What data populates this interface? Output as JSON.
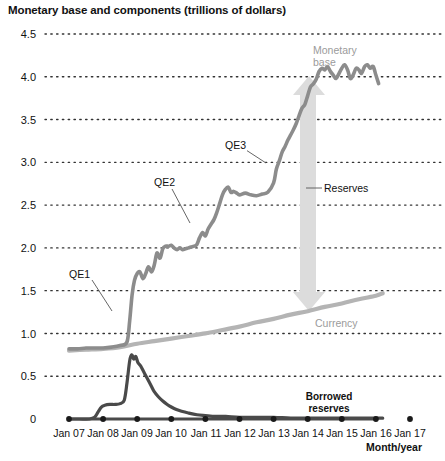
{
  "chart_data": {
    "type": "line",
    "title": "Monetary base and components (trillions of dollars)",
    "xlabel": "Month/year",
    "ylabel": "",
    "ylim": [
      0,
      4.5
    ],
    "ytick_labels": [
      "0",
      "0.5",
      "1.0",
      "1.5",
      "2.0",
      "2.5",
      "3.0",
      "3.5",
      "4.0",
      "4.5"
    ],
    "ytick_values": [
      0,
      0.5,
      1.0,
      1.5,
      2.0,
      2.5,
      3.0,
      3.5,
      4.0,
      4.5
    ],
    "xtick_labels": [
      "Jan 07",
      "Jan 08",
      "Jan 09",
      "Jan 10",
      "Jan 11",
      "Jan 12",
      "Jan 13",
      "Jan 14",
      "Jan 15",
      "Jan 16",
      "Jan 17"
    ],
    "xtick_values": [
      2007,
      2008,
      2009,
      2010,
      2011,
      2012,
      2013,
      2014,
      2015,
      2016,
      2017
    ],
    "xlim": [
      2007,
      2017
    ],
    "grid": "horizontal-dotted",
    "legend": "inline-annotations",
    "series": [
      {
        "name": "Monetary base",
        "color": "#8c8c8c",
        "x": [
          2007.0,
          2007.25,
          2007.5,
          2007.75,
          2008.0,
          2008.25,
          2008.5,
          2008.7,
          2008.78,
          2008.85,
          2008.92,
          2009.0,
          2009.08,
          2009.17,
          2009.25,
          2009.33,
          2009.42,
          2009.5,
          2009.58,
          2009.67,
          2009.75,
          2009.83,
          2009.92,
          2010.0,
          2010.08,
          2010.17,
          2010.25,
          2010.33,
          2010.42,
          2010.5,
          2010.58,
          2010.67,
          2010.75,
          2010.83,
          2010.92,
          2011.0,
          2011.08,
          2011.17,
          2011.25,
          2011.33,
          2011.42,
          2011.5,
          2011.58,
          2011.67,
          2011.75,
          2011.83,
          2011.92,
          2012.0,
          2012.17,
          2012.33,
          2012.5,
          2012.67,
          2012.83,
          2013.0,
          2013.08,
          2013.17,
          2013.25,
          2013.33,
          2013.42,
          2013.5,
          2013.58,
          2013.67,
          2013.75,
          2013.83,
          2013.92,
          2014.0,
          2014.08,
          2014.17,
          2014.25,
          2014.33,
          2014.42,
          2014.5,
          2014.58,
          2014.67,
          2014.75,
          2014.83,
          2014.92,
          2015.0,
          2015.08,
          2015.17,
          2015.25,
          2015.33,
          2015.42,
          2015.5,
          2015.58,
          2015.67,
          2015.75,
          2015.83,
          2015.92,
          2016.0,
          2016.08
        ],
        "y": [
          0.82,
          0.82,
          0.83,
          0.83,
          0.83,
          0.84,
          0.86,
          0.9,
          1.15,
          1.45,
          1.62,
          1.7,
          1.72,
          1.64,
          1.7,
          1.78,
          1.72,
          1.8,
          1.94,
          1.88,
          1.99,
          2.02,
          2.02,
          2.03,
          2.0,
          1.98,
          2.0,
          1.98,
          1.99,
          2.0,
          2.01,
          2.02,
          2.04,
          2.12,
          2.18,
          2.14,
          2.22,
          2.28,
          2.33,
          2.41,
          2.52,
          2.62,
          2.68,
          2.71,
          2.65,
          2.66,
          2.64,
          2.62,
          2.64,
          2.62,
          2.61,
          2.63,
          2.65,
          2.76,
          2.92,
          3.02,
          3.12,
          3.18,
          3.26,
          3.32,
          3.38,
          3.46,
          3.55,
          3.63,
          3.68,
          3.78,
          3.88,
          3.92,
          3.97,
          4.06,
          4.1,
          4.08,
          4.12,
          4.06,
          4.02,
          3.98,
          4.04,
          4.1,
          4.14,
          4.08,
          3.98,
          4.02,
          4.1,
          4.08,
          4.04,
          4.12,
          4.14,
          4.1,
          4.12,
          4.02,
          3.92
        ]
      },
      {
        "name": "Currency",
        "color": "#b4b4b4",
        "x": [
          2007.0,
          2007.5,
          2008.0,
          2008.5,
          2009.0,
          2009.5,
          2010.0,
          2010.5,
          2011.0,
          2011.5,
          2012.0,
          2012.5,
          2013.0,
          2013.5,
          2014.0,
          2014.5,
          2015.0,
          2015.5,
          2016.0,
          2016.2
        ],
        "y": [
          0.8,
          0.81,
          0.82,
          0.84,
          0.88,
          0.91,
          0.94,
          0.97,
          1.0,
          1.04,
          1.08,
          1.13,
          1.17,
          1.22,
          1.26,
          1.31,
          1.35,
          1.4,
          1.44,
          1.47
        ]
      },
      {
        "name": "Borrowed reserves",
        "color": "#4a4a4a",
        "x": [
          2007.0,
          2007.3,
          2007.6,
          2007.75,
          2007.85,
          2007.95,
          2008.05,
          2008.2,
          2008.35,
          2008.5,
          2008.62,
          2008.7,
          2008.78,
          2008.84,
          2008.9,
          2008.96,
          2009.02,
          2009.1,
          2009.18,
          2009.26,
          2009.34,
          2009.42,
          2009.5,
          2009.62,
          2009.75,
          2009.88,
          2010.0,
          2010.15,
          2010.3,
          2010.5,
          2010.75,
          2011.0,
          2011.3,
          2011.6,
          2012.0,
          2012.5,
          2013.0,
          2013.5,
          2014.0,
          2014.5,
          2015.0,
          2015.5,
          2016.0,
          2016.2
        ],
        "y": [
          0.0,
          0.0,
          0.0,
          0.02,
          0.08,
          0.14,
          0.16,
          0.17,
          0.17,
          0.18,
          0.22,
          0.42,
          0.68,
          0.75,
          0.7,
          0.73,
          0.66,
          0.62,
          0.56,
          0.5,
          0.44,
          0.38,
          0.32,
          0.26,
          0.21,
          0.17,
          0.14,
          0.11,
          0.09,
          0.07,
          0.05,
          0.04,
          0.03,
          0.03,
          0.02,
          0.02,
          0.02,
          0.01,
          0.01,
          0.01,
          0.01,
          0.01,
          0.01,
          0.01
        ]
      }
    ],
    "annotations": [
      {
        "name": "qe1",
        "text": "QE1",
        "style": "boxed-dark"
      },
      {
        "name": "qe2",
        "text": "QE2",
        "style": "boxed-dark"
      },
      {
        "name": "qe3",
        "text": "QE3",
        "style": "boxed-dark"
      },
      {
        "name": "monetary-base",
        "text_line1": "Monetary",
        "text_line2": "base",
        "style": "gray"
      },
      {
        "name": "reserves",
        "text": "Reserves",
        "style": "boxed-dark"
      },
      {
        "name": "currency",
        "text": "Currency",
        "style": "gray"
      },
      {
        "name": "borrowed-reserves",
        "text_line1": "Borrowed",
        "text_line2": "reserves",
        "style": "bold-dark"
      }
    ],
    "arrow": {
      "name": "reserves-arrow",
      "color": "#dcdcdc",
      "direction": "double-vertical"
    }
  }
}
